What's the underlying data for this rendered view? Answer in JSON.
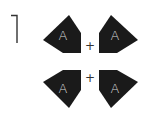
{
  "figure": {
    "number_label": "1",
    "shape_color": "#1a1a1a",
    "letter_color": "#d8d8d8",
    "shapes": [
      {
        "id": "top-left",
        "letter": "A",
        "points": "69,15 81,33 81,53 63,53 43,40",
        "label_x": 63,
        "label_y": 40
      },
      {
        "id": "top-right",
        "letter": "A",
        "points": "111,15 99,33 99,53 117,53 138,40",
        "label_x": 115,
        "label_y": 40
      },
      {
        "id": "bottom-left",
        "letter": "A",
        "points": "63,70 81,70 81,90 69,108 43,82",
        "label_x": 63,
        "label_y": 93
      },
      {
        "id": "bottom-right",
        "letter": "A",
        "points": "99,70 117,70 138,82 111,108 99,90",
        "label_x": 115,
        "label_y": 93
      }
    ],
    "operators": [
      {
        "id": "top-plus",
        "symbol": "+",
        "x": 90,
        "y": 50
      },
      {
        "id": "bottom-plus",
        "symbol": "+",
        "x": 90,
        "y": 82
      }
    ]
  }
}
